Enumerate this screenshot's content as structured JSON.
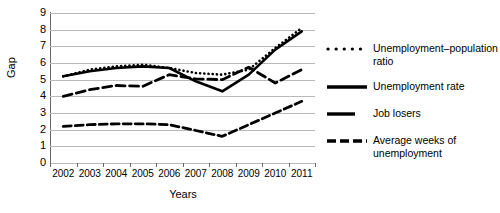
{
  "chart_data": {
    "type": "line",
    "title": "",
    "xlabel": "Years",
    "ylabel": "Gap",
    "categories": [
      "2002",
      "2003",
      "2004",
      "2005",
      "2006",
      "2007",
      "2008",
      "2009",
      "2010",
      "2011"
    ],
    "ylim": [
      0,
      9
    ],
    "yticks": [
      0,
      1,
      2,
      3,
      4,
      5,
      6,
      7,
      8,
      9
    ],
    "grid": true,
    "legend_position": "right",
    "series": [
      {
        "name": "Unemployment–population ratio",
        "style": "dotted",
        "values": [
          5.2,
          5.6,
          5.8,
          5.9,
          5.7,
          5.4,
          5.3,
          5.6,
          6.9,
          8.1
        ]
      },
      {
        "name": "Unemployment rate",
        "style": "solid",
        "values": [
          5.2,
          5.5,
          5.7,
          5.8,
          5.7,
          4.9,
          4.3,
          5.3,
          6.8,
          7.9
        ]
      },
      {
        "name": "Job losers",
        "style": "dashed",
        "values": [
          2.2,
          2.3,
          2.35,
          2.35,
          2.3,
          1.95,
          1.6,
          2.3,
          3.0,
          3.7
        ]
      },
      {
        "name": "Average weeks of unemployment",
        "style": "dashed-long",
        "values": [
          4.0,
          4.4,
          4.65,
          4.6,
          5.3,
          5.05,
          5.0,
          5.75,
          4.8,
          5.6
        ]
      }
    ]
  },
  "legend": {
    "items": [
      {
        "label": "Unemployment–population ratio",
        "style": "dotted"
      },
      {
        "label": "Unemployment rate",
        "style": "solid"
      },
      {
        "label": "Job losers",
        "style": "solid-short"
      },
      {
        "label": "Average weeks of unemployment",
        "style": "dashed"
      }
    ]
  }
}
